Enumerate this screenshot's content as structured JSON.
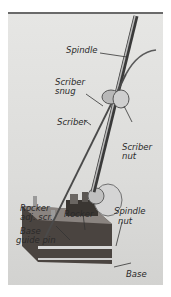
{
  "figure": {
    "labels": {
      "spindle": "Spindle",
      "scriber_snug_1": "Scriber",
      "scriber_snug_2": "snug",
      "scriber": "Scriber",
      "scriber_nut_1": "Scriber",
      "scriber_nut_2": "nut",
      "rocker_adj_1": "Rocker",
      "rocker_adj_2": "adj. scr.",
      "rocker": "Rocker",
      "spindle_nut_1": "Spindle",
      "spindle_nut_2": "nut",
      "base_guide_1": "Base",
      "base_guide_2": "guide pin",
      "base": "Base"
    },
    "colors": {
      "background": "#dcdcda",
      "frame": "#6a6a6a",
      "metal_dark": "#3a3a3a",
      "metal_light": "#bdbdbd",
      "text": "#2a2a2a"
    }
  }
}
